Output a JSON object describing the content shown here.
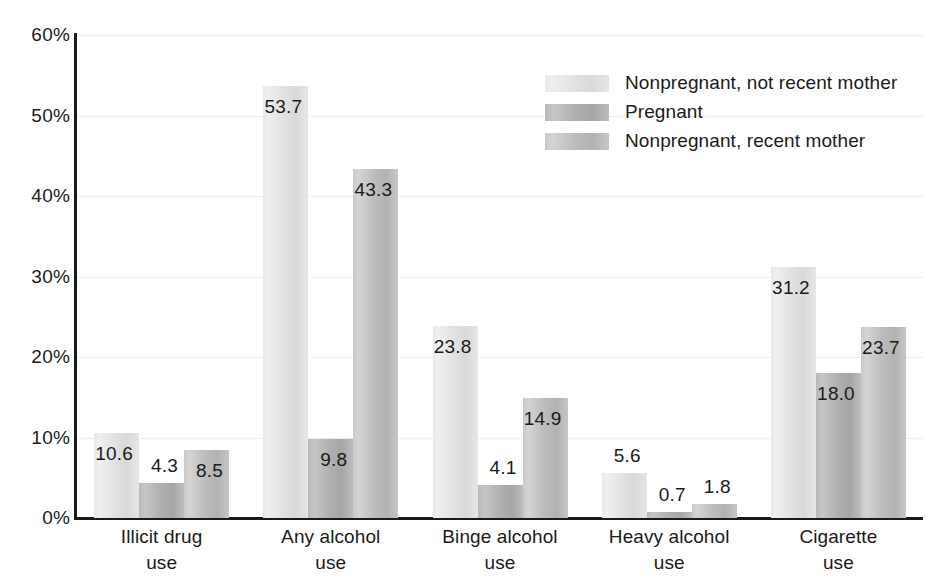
{
  "chart_data": {
    "type": "bar",
    "title": "",
    "subtitle": "",
    "xlabel": "",
    "ylabel": "",
    "ylim": [
      0,
      60
    ],
    "ytick_step": 10,
    "ytick_labels": [
      "0%",
      "10%",
      "20%",
      "30%",
      "40%",
      "50%",
      "60%"
    ],
    "ytick_values": [
      0,
      10,
      20,
      30,
      40,
      50,
      60
    ],
    "grid": true,
    "grid_axis": "y",
    "legend_position": "top-right",
    "value_label_format": "one-decimal",
    "categories": [
      "Illicit drug\nuse",
      "Any alcohol\nuse",
      "Binge alcohol\nuse",
      "Heavy alcohol\nuse",
      "Cigarette\nuse"
    ],
    "category_lines": [
      [
        "Illicit drug",
        "use"
      ],
      [
        "Any alcohol",
        "use"
      ],
      [
        "Binge alcohol",
        "use"
      ],
      [
        "Heavy alcohol",
        "use"
      ],
      [
        "Cigarette",
        "use"
      ]
    ],
    "series": [
      {
        "name": "Nonpregnant, not recent mother",
        "color": "#e4e4e4",
        "values": [
          10.6,
          53.7,
          23.8,
          5.6,
          31.2
        ],
        "labels": [
          "10.6",
          "53.7",
          "23.8",
          "5.6",
          "31.2"
        ]
      },
      {
        "name": "Pregnant",
        "color": "#b4b4b4",
        "values": [
          4.3,
          9.8,
          4.1,
          0.7,
          18.0
        ],
        "labels": [
          "4.3",
          "9.8",
          "4.1",
          "0.7",
          "18.0"
        ]
      },
      {
        "name": "Nonpregnant, recent mother",
        "color": "#c2c2c2",
        "values": [
          8.5,
          43.3,
          14.9,
          1.8,
          23.7
        ],
        "labels": [
          "8.5",
          "43.3",
          "14.9",
          "1.8",
          "23.7"
        ]
      }
    ]
  },
  "legend": {
    "items": [
      {
        "label": "Nonpregnant, not recent mother"
      },
      {
        "label": "Pregnant"
      },
      {
        "label": "Nonpregnant, recent mother"
      }
    ]
  },
  "axis": {
    "y_ticks": [
      {
        "label": "60%",
        "value": 60
      },
      {
        "label": "50%",
        "value": 50
      },
      {
        "label": "40%",
        "value": 40
      },
      {
        "label": "30%",
        "value": 30
      },
      {
        "label": "20%",
        "value": 20
      },
      {
        "label": "10%",
        "value": 10
      },
      {
        "label": "0%",
        "value": 0
      }
    ]
  }
}
